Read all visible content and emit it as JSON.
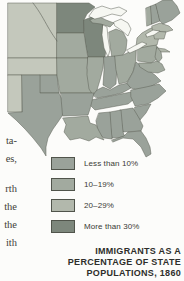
{
  "page_type": "scanned textbook map",
  "left_column_fragments": [
    {
      "text": "ta-",
      "y": 135
    },
    {
      "text": "es,",
      "y": 153
    },
    {
      "text": "rth",
      "y": 183
    },
    {
      "text": "the",
      "y": 201
    },
    {
      "text": "the",
      "y": 219
    },
    {
      "text": "ith",
      "y": 237
    }
  ],
  "map": {
    "title_lines": [
      "IMMIGRANTS AS A",
      "PERCENTAGE OF STATE",
      "POPULATIONS, 1860"
    ],
    "legend": [
      {
        "label": "Less than 10%",
        "category": "less10"
      },
      {
        "label": "10–19%",
        "category": "c10_19"
      },
      {
        "label": "20–29%",
        "category": "c20_29"
      },
      {
        "label": "More than 30%",
        "category": "more30"
      }
    ],
    "colors": {
      "less10": "#9aa29a",
      "c10_19": "#a2aa9f",
      "c20_29": "#b2b8ac",
      "more30": "#7d877c",
      "territory": "#c4c8bc",
      "water": "#f6f7f2",
      "border": "#5c6057",
      "page": "#fcfcfa"
    },
    "regions": [
      {
        "name": "dakota-nebraska-territory",
        "category": "territory"
      },
      {
        "name": "kansas-territory",
        "category": "territory"
      },
      {
        "name": "new-mexico-territory",
        "category": "territory"
      },
      {
        "name": "indian-territory",
        "category": "less10"
      },
      {
        "name": "texas",
        "category": "less10"
      },
      {
        "name": "minnesota",
        "category": "more30"
      },
      {
        "name": "wisconsin",
        "category": "more30"
      },
      {
        "name": "iowa",
        "category": "c10_19"
      },
      {
        "name": "missouri",
        "category": "c10_19"
      },
      {
        "name": "michigan-upper",
        "category": "c10_19"
      },
      {
        "name": "michigan-lower",
        "category": "c10_19"
      },
      {
        "name": "illinois",
        "category": "c10_19"
      },
      {
        "name": "indiana",
        "category": "less10"
      },
      {
        "name": "ohio",
        "category": "c10_19"
      },
      {
        "name": "kentucky",
        "category": "less10"
      },
      {
        "name": "tennessee",
        "category": "less10"
      },
      {
        "name": "virginia",
        "category": "less10"
      },
      {
        "name": "north-carolina",
        "category": "less10"
      },
      {
        "name": "south-carolina",
        "category": "less10"
      },
      {
        "name": "georgia",
        "category": "less10"
      },
      {
        "name": "alabama",
        "category": "less10"
      },
      {
        "name": "mississippi",
        "category": "less10"
      },
      {
        "name": "arkansas",
        "category": "less10"
      },
      {
        "name": "louisiana",
        "category": "c10_19"
      },
      {
        "name": "florida",
        "category": "less10"
      },
      {
        "name": "pennsylvania",
        "category": "c10_19"
      },
      {
        "name": "new-york",
        "category": "c20_29"
      },
      {
        "name": "long-island",
        "category": "c20_29"
      },
      {
        "name": "new-jersey",
        "category": "c10_19"
      },
      {
        "name": "maryland-delaware",
        "category": "c10_19"
      },
      {
        "name": "vermont",
        "category": "c10_19"
      },
      {
        "name": "new-hampshire",
        "category": "less10"
      },
      {
        "name": "maine",
        "category": "less10"
      },
      {
        "name": "massachusetts",
        "category": "c20_29"
      },
      {
        "name": "connecticut-rhode-island",
        "category": "c20_29"
      }
    ]
  }
}
